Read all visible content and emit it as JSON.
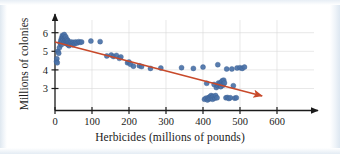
{
  "figure": {
    "name": "herbicides-vs-colonies-scatter",
    "background_color": "#ffffff",
    "frame_color": "#e2eaf2"
  },
  "chart_data": {
    "type": "scatter",
    "title": "",
    "subtitle": "",
    "xlabel": "Herbicides (millions of pounds)",
    "ylabel": "Millions of colonies",
    "xlim": [
      -20,
      640
    ],
    "ylim": [
      2.05,
      6.35
    ],
    "xticks": [
      0,
      100,
      200,
      300,
      400,
      500,
      600
    ],
    "yticks": [
      3,
      4,
      5,
      6
    ],
    "xtick_labels": [
      "0",
      "100",
      "200",
      "300",
      "400",
      "500",
      "600"
    ],
    "ytick_labels": [
      "3",
      "4",
      "5",
      "6"
    ],
    "grid": true,
    "grid_color": "#d8d8d8",
    "legend": "none",
    "axis_color": "#1b1b1b",
    "point_color": "#4a72a8",
    "point_edge_color": "#3a5d8f",
    "point_radius": 2.5,
    "series": [
      {
        "name": "Honeybee colonies vs herbicide use",
        "marker": "circle",
        "color": "#4a72a8",
        "points": [
          [
            4,
            4.45
          ],
          [
            5,
            4.6
          ],
          [
            6,
            4.38
          ],
          [
            8,
            5.0
          ],
          [
            10,
            4.9
          ],
          [
            12,
            5.2
          ],
          [
            14,
            5.45
          ],
          [
            16,
            5.6
          ],
          [
            17,
            5.35
          ],
          [
            18,
            5.72
          ],
          [
            19,
            5.55
          ],
          [
            20,
            5.85
          ],
          [
            21,
            5.7
          ],
          [
            22,
            5.62
          ],
          [
            23,
            5.8
          ],
          [
            24,
            5.5
          ],
          [
            25,
            5.9
          ],
          [
            26,
            5.68
          ],
          [
            27,
            5.45
          ],
          [
            28,
            5.6
          ],
          [
            29,
            5.78
          ],
          [
            30,
            5.52
          ],
          [
            31,
            5.4
          ],
          [
            32,
            5.65
          ],
          [
            33,
            5.5
          ],
          [
            34,
            5.42
          ],
          [
            35,
            5.58
          ],
          [
            36,
            5.35
          ],
          [
            37,
            5.48
          ],
          [
            38,
            5.3
          ],
          [
            40,
            5.45
          ],
          [
            42,
            5.38
          ],
          [
            44,
            5.5
          ],
          [
            46,
            5.42
          ],
          [
            48,
            5.35
          ],
          [
            50,
            5.48
          ],
          [
            53,
            5.4
          ],
          [
            56,
            5.5
          ],
          [
            60,
            5.45
          ],
          [
            64,
            5.52
          ],
          [
            68,
            5.48
          ],
          [
            72,
            5.5
          ],
          [
            97,
            5.55
          ],
          [
            122,
            5.52
          ],
          [
            140,
            4.75
          ],
          [
            152,
            4.8
          ],
          [
            158,
            4.72
          ],
          [
            166,
            4.78
          ],
          [
            174,
            4.62
          ],
          [
            178,
            4.7
          ],
          [
            196,
            4.38
          ],
          [
            200,
            4.42
          ],
          [
            204,
            4.3
          ],
          [
            212,
            4.2
          ],
          [
            228,
            4.22
          ],
          [
            234,
            4.18
          ],
          [
            258,
            4.08
          ],
          [
            286,
            4.1
          ],
          [
            342,
            4.12
          ],
          [
            374,
            4.08
          ],
          [
            400,
            4.15
          ],
          [
            404,
            2.42
          ],
          [
            408,
            2.48
          ],
          [
            410,
            3.28
          ],
          [
            412,
            2.38
          ],
          [
            414,
            2.5
          ],
          [
            416,
            2.44
          ],
          [
            418,
            2.55
          ],
          [
            420,
            2.46
          ],
          [
            422,
            2.62
          ],
          [
            424,
            2.52
          ],
          [
            426,
            2.42
          ],
          [
            428,
            2.58
          ],
          [
            430,
            3.22
          ],
          [
            432,
            2.48
          ],
          [
            434,
            2.62
          ],
          [
            436,
            3.05
          ],
          [
            438,
            2.5
          ],
          [
            440,
            3.15
          ],
          [
            442,
            3.3
          ],
          [
            444,
            3.2
          ],
          [
            446,
            3.28
          ],
          [
            448,
            3.1
          ],
          [
            450,
            3.35
          ],
          [
            452,
            3.42
          ],
          [
            454,
            3.18
          ],
          [
            456,
            3.45
          ],
          [
            458,
            3.3
          ],
          [
            440,
            4.28
          ],
          [
            462,
            2.5
          ],
          [
            466,
            2.52
          ],
          [
            470,
            2.46
          ],
          [
            474,
            2.5
          ],
          [
            464,
            4.05
          ],
          [
            478,
            4.05
          ],
          [
            482,
            3.15
          ],
          [
            486,
            2.48
          ],
          [
            490,
            2.5
          ],
          [
            492,
            4.1
          ],
          [
            500,
            4.12
          ],
          [
            506,
            4.08
          ],
          [
            512,
            4.15
          ]
        ]
      }
    ],
    "trendline": {
      "name": "negative-trend-arrow",
      "color": "#c8492a",
      "width": 1.6,
      "arrow": true,
      "start": [
        0,
        5.5
      ],
      "end": [
        560,
        2.6
      ]
    }
  }
}
